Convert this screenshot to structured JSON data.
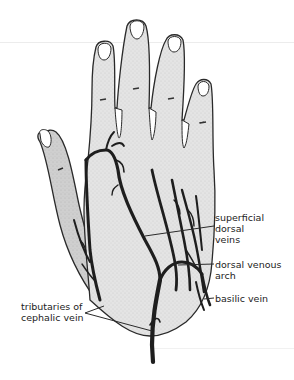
{
  "diagram": {
    "colors": {
      "skin_fill": "#e6e6e6",
      "thumb_fill": "#d2d2d2",
      "outline": "#2a2a2a",
      "vein": "#1e1e1e",
      "leader_line": "#2a2a2a",
      "label_text": "#1c1c1c",
      "background": "#ffffff"
    },
    "labels": [
      {
        "id": "superficial-dorsal-veins",
        "lines": [
          "superficial",
          "dorsal",
          "veins"
        ]
      },
      {
        "id": "dorsal-venous-arch",
        "lines": [
          "dorsal venous",
          "arch"
        ]
      },
      {
        "id": "basilic-vein",
        "lines": [
          "basilic vein"
        ]
      },
      {
        "id": "tributaries-of-cephalic-vein",
        "lines": [
          "tributaries of",
          "cephalic vein"
        ]
      }
    ]
  }
}
